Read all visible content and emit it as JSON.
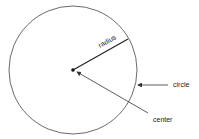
{
  "diagram": {
    "labels": {
      "radius": "radius",
      "circle": "circle",
      "center": "center"
    },
    "colors": {
      "stroke": "#333333",
      "background": "#ffffff"
    }
  }
}
